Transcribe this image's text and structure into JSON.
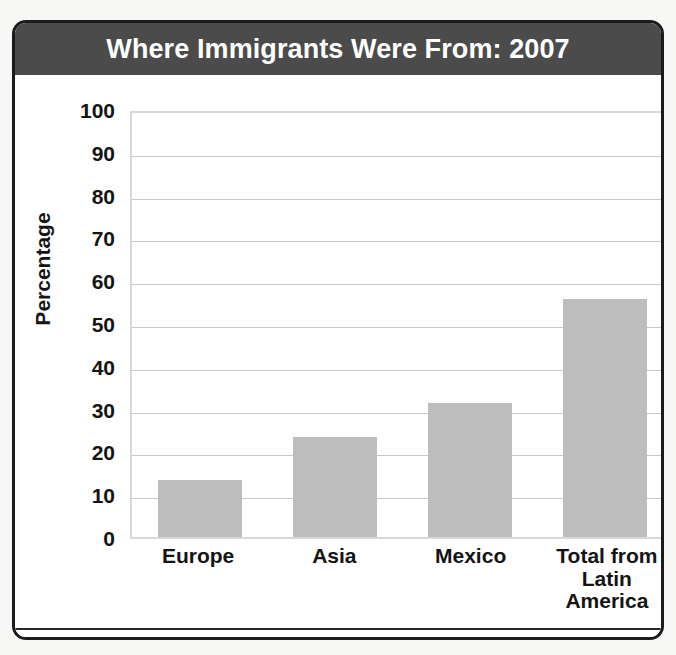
{
  "figure": {
    "title": "Where Immigrants Were From: 2007",
    "source_note": "SOURCE: Center for Immigration Studies,U.S. Census Bureau",
    "colors": {
      "title_bar": "#4b4b4b",
      "title_text": "#ffffff",
      "bar_fill": "#bdbdbd",
      "gridline": "#c9c9c9",
      "plot_border": "#d8d8d8",
      "frame_border": "#1b1b1b",
      "text": "#141414",
      "background": "#ffffff"
    }
  },
  "chart_data": {
    "type": "bar",
    "title": "Where Immigrants Were From: 2007",
    "xlabel": "",
    "ylabel": "Percentage",
    "categories": [
      "Europe",
      "Asia",
      "Mexico",
      "Total from Latin America"
    ],
    "category_lines": [
      [
        "Europe"
      ],
      [
        "Asia"
      ],
      [
        "Mexico"
      ],
      [
        "Total from",
        "Latin",
        "America"
      ]
    ],
    "values": [
      13.4,
      23.4,
      31.4,
      55.6
    ],
    "ylim": [
      0,
      100
    ],
    "yticks": [
      100,
      90,
      80,
      70,
      60,
      50,
      40,
      30,
      20,
      10,
      0
    ],
    "ytick_labels": [
      "100",
      "90",
      "80",
      "70",
      "60",
      "50",
      "40",
      "30",
      "20",
      "10",
      "0"
    ],
    "grid": true,
    "grid_axis": "y",
    "legend": false,
    "legend_position": "none",
    "series": [
      {
        "name": "Percentage of immigrants",
        "values": [
          13.4,
          23.4,
          31.4,
          55.6
        ]
      }
    ]
  }
}
